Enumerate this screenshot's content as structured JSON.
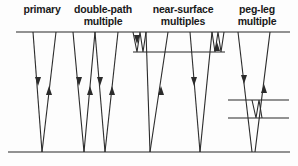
{
  "figure": {
    "background_color": "#fdfdfd",
    "line_color": "#2b2b2b",
    "surface_line_color": "#6e6e6e"
  },
  "labels": [
    {
      "id": "primary",
      "text": "primary"
    },
    {
      "id": "double_path_multiple",
      "text": "double-path\nmultiple"
    },
    {
      "id": "near_surface_multiples",
      "text": "near-surface\nmultiples"
    },
    {
      "id": "peg_leg_multiple",
      "text": "peg-leg\nmultiple"
    }
  ],
  "interfaces": [
    {
      "id": "surface",
      "label": "surface",
      "x1": 16,
      "y1": 32,
      "x2": 290,
      "y2": 32
    },
    {
      "id": "near-surface-layer",
      "label": "near-surface layer",
      "x1": 133,
      "y1": 52,
      "x2": 225,
      "y2": 52
    },
    {
      "id": "peg-leg-upper-layer",
      "label": "peg-leg upper layer",
      "x1": 228,
      "y1": 100,
      "x2": 289,
      "y2": 100
    },
    {
      "id": "peg-leg-lower-layer",
      "label": "peg-leg lower layer",
      "x1": 228,
      "y1": 118,
      "x2": 289,
      "y2": 118
    },
    {
      "id": "reflector",
      "label": "deep reflector",
      "x1": 8,
      "y1": 152,
      "x2": 290,
      "y2": 152
    }
  ],
  "raypaths": [
    {
      "id": "primary-down",
      "group": "primary",
      "points": "33,32 42,152"
    },
    {
      "id": "primary-up",
      "group": "primary",
      "points": "42,152 56,32"
    },
    {
      "id": "double-down-1",
      "group": "double",
      "points": "73,32 84,152"
    },
    {
      "id": "double-up-1",
      "group": "double",
      "points": "84,152 95,32"
    },
    {
      "id": "double-down-2",
      "group": "double",
      "points": "95,32 105,152"
    },
    {
      "id": "double-up-2",
      "group": "double",
      "points": "105,152 118,32"
    },
    {
      "id": "nearsurf-zigzag-left",
      "group": "nearsurf",
      "points": "133,32 137,52 140,32 143,52 146,32"
    },
    {
      "id": "nearsurf-down-1",
      "group": "nearsurf",
      "points": "146,32 150,152"
    },
    {
      "id": "nearsurf-up-1",
      "group": "nearsurf",
      "points": "150,152 168,32"
    },
    {
      "id": "nearsurf-down-2",
      "group": "nearsurf",
      "points": "190,32 200,152"
    },
    {
      "id": "nearsurf-up-2",
      "group": "nearsurf",
      "points": "200,152 212,32"
    },
    {
      "id": "nearsurf-zigzag-right",
      "group": "nearsurf",
      "points": "212,32 215,52 218,32 221,52 224,32"
    },
    {
      "id": "pegleg-down",
      "group": "pegleg",
      "points": "238,32 252,152"
    },
    {
      "id": "pegleg-zigzag",
      "group": "pegleg",
      "points": "252,100 256,118 259,100 262,118"
    },
    {
      "id": "pegleg-up",
      "group": "pegleg",
      "points": "255,152 270,32"
    }
  ],
  "arrowheads": [
    {
      "id": "primary-down-arrow",
      "x": 38,
      "y": 86,
      "dir": "down"
    },
    {
      "id": "primary-up-arrow",
      "x": 49,
      "y": 86,
      "dir": "up"
    },
    {
      "id": "double-down-arrow-1",
      "x": 79,
      "y": 86,
      "dir": "down"
    },
    {
      "id": "double-up-arrow-1",
      "x": 90,
      "y": 86,
      "dir": "up"
    },
    {
      "id": "double-down-arrow-2",
      "x": 100,
      "y": 86,
      "dir": "down"
    },
    {
      "id": "double-up-arrow-2",
      "x": 112,
      "y": 86,
      "dir": "up"
    },
    {
      "id": "nearsurf-zig-arrow-l",
      "x": 137,
      "y": 44,
      "dir": "down"
    },
    {
      "id": "nearsurf-up-arrow-1",
      "x": 161,
      "y": 86,
      "dir": "up"
    },
    {
      "id": "nearsurf-down-arrow-2",
      "x": 194,
      "y": 86,
      "dir": "down"
    },
    {
      "id": "nearsurf-zig-arrow-r",
      "x": 217,
      "y": 42,
      "dir": "up"
    },
    {
      "id": "pegleg-down-arrow",
      "x": 244,
      "y": 84,
      "dir": "down"
    },
    {
      "id": "pegleg-up-arrow",
      "x": 264,
      "y": 84,
      "dir": "up"
    }
  ]
}
